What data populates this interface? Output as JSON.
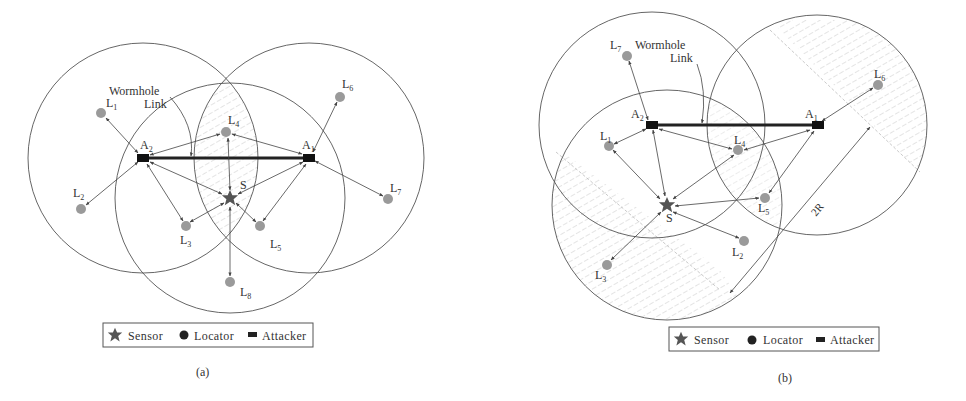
{
  "figure": {
    "panels": [
      {
        "id": "a",
        "caption": "(a)",
        "wormhole_label": [
          "Wormhole",
          "Link"
        ],
        "sensor_label": "S",
        "attackers": [
          {
            "name": "A",
            "sub": "2",
            "x": 143,
            "y": 158
          },
          {
            "name": "A",
            "sub": "1",
            "x": 309,
            "y": 158
          }
        ],
        "locators": [
          {
            "name": "L",
            "sub": "1",
            "x": 101,
            "y": 113
          },
          {
            "name": "L",
            "sub": "2",
            "x": 81,
            "y": 209
          },
          {
            "name": "L",
            "sub": "3",
            "x": 186,
            "y": 226
          },
          {
            "name": "L",
            "sub": "4",
            "x": 226,
            "y": 132
          },
          {
            "name": "L",
            "sub": "5",
            "x": 260,
            "y": 226
          },
          {
            "name": "L",
            "sub": "6",
            "x": 340,
            "y": 97
          },
          {
            "name": "L",
            "sub": "7",
            "x": 388,
            "y": 199
          },
          {
            "name": "L",
            "sub": "8",
            "x": 230,
            "y": 282
          }
        ],
        "sensor": {
          "x": 230,
          "y": 198
        }
      },
      {
        "id": "b",
        "caption": "(b)",
        "wormhole_label": [
          "Wormhole",
          "Link"
        ],
        "sensor_label": "S",
        "distance_label": "2R",
        "attackers": [
          {
            "name": "A",
            "sub": "2",
            "x": 652,
            "y": 125
          },
          {
            "name": "A",
            "sub": "1",
            "x": 817,
            "y": 125
          }
        ],
        "locators": [
          {
            "name": "L",
            "sub": "1",
            "x": 609,
            "y": 146
          },
          {
            "name": "L",
            "sub": "2",
            "x": 744,
            "y": 241
          },
          {
            "name": "L",
            "sub": "3",
            "x": 607,
            "y": 265
          },
          {
            "name": "L",
            "sub": "4",
            "x": 738,
            "y": 150
          },
          {
            "name": "L",
            "sub": "5",
            "x": 765,
            "y": 198
          },
          {
            "name": "L",
            "sub": "6",
            "x": 878,
            "y": 85
          },
          {
            "name": "L",
            "sub": "7",
            "x": 627,
            "y": 56
          }
        ],
        "sensor": {
          "x": 667,
          "y": 205
        }
      }
    ],
    "legend": {
      "sensor": "Sensor",
      "locator": "Locator",
      "attacker": "Attacker"
    }
  }
}
